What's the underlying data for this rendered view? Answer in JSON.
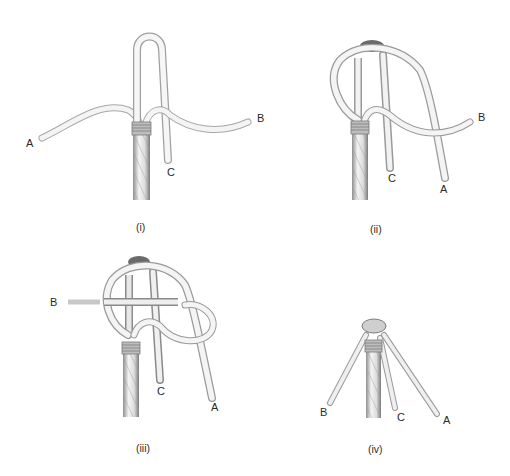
{
  "figure": {
    "panels": [
      {
        "id": "i",
        "caption": "(i)",
        "labels": {
          "A": "A",
          "B": "B",
          "C": "C"
        }
      },
      {
        "id": "ii",
        "caption": "(ii)",
        "labels": {
          "A": "A",
          "B": "B",
          "C": "C"
        }
      },
      {
        "id": "iii",
        "caption": "(iii)",
        "labels": {
          "A": "A",
          "B": "B",
          "C": "C"
        }
      },
      {
        "id": "iv",
        "caption": "(iv)",
        "labels": {
          "A": "A",
          "B": "B",
          "C": "C"
        }
      }
    ],
    "colors": {
      "rope_fill": "#f2f2f2",
      "rope_edge": "#9a9a9a",
      "rope_shadow": "#6e6e6e",
      "whipping": "#8a8a8a",
      "text": "#2a2a2a",
      "background": "#ffffff"
    }
  }
}
